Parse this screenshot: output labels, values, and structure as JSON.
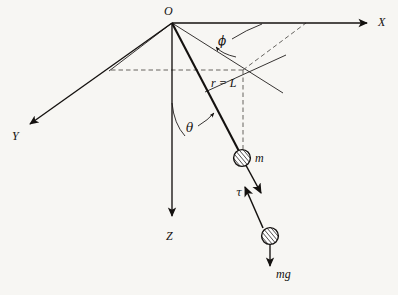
{
  "figure": {
    "background_color": "#f7f6f3",
    "ink_color": "#14110f",
    "labels": {
      "origin": "O",
      "axis_x": "X",
      "axis_y": "Y",
      "axis_z": "Z",
      "angle_phi": "ϕ",
      "angle_theta": "θ",
      "radius": "r = L",
      "mass": "m",
      "tension": "τ",
      "weight": "mg"
    }
  },
  "geometry": {
    "origin": {
      "x": 172,
      "y": 23
    },
    "axes": [
      {
        "name": "x-axis",
        "label": "X",
        "from": [
          172,
          23
        ],
        "to": [
          372,
          23
        ],
        "label_pos": [
          379,
          27
        ]
      },
      {
        "name": "y-axis",
        "label": "Y",
        "from": [
          172,
          23
        ],
        "to": [
          26,
          127
        ],
        "label_pos": [
          13,
          140
        ]
      },
      {
        "name": "z-axis",
        "label": "Z",
        "from": [
          172,
          23
        ],
        "to": [
          172,
          222
        ],
        "label_pos": [
          168,
          240
        ]
      }
    ],
    "rod": {
      "name": "r-equals-L",
      "from": [
        172,
        23
      ],
      "to": [
        242,
        158
      ],
      "label": "r = L",
      "label_pos": [
        212,
        86
      ]
    },
    "masses": [
      {
        "name": "pendulum-bob",
        "cx": 242,
        "cy": 158,
        "r": 8.5,
        "label": "m",
        "label_pos": [
          256,
          161
        ]
      },
      {
        "name": "free-body-bob",
        "cx": 270,
        "cy": 236,
        "r": 8.5
      }
    ],
    "vectors": [
      {
        "name": "tension-vector",
        "from": [
          262,
          200
        ],
        "to": [
          243,
          184
        ],
        "label": "τ",
        "label_pos": [
          238,
          193
        ]
      },
      {
        "name": "weight-vector",
        "from": [
          270,
          244
        ],
        "to": [
          270,
          270
        ],
        "label": "mg",
        "label_pos": [
          277,
          277
        ]
      },
      {
        "name": "bob-direction",
        "from": [
          242,
          158
        ],
        "to": [
          263,
          196
        ]
      }
    ],
    "angle_marks": [
      {
        "name": "phi-angle",
        "label": "ϕ",
        "label_pos": [
          222,
          44
        ]
      },
      {
        "name": "theta-angle",
        "label": "θ",
        "label_pos": [
          189,
          131
        ]
      }
    ],
    "projection_lines": [
      {
        "name": "horizontal-projection-dashed",
        "from": [
          111,
          70
        ],
        "to": [
          243,
          70
        ],
        "style": "dashed"
      },
      {
        "name": "vertical-drop-dashed",
        "from": [
          243,
          70
        ],
        "to": [
          243,
          150
        ],
        "style": "dashed"
      },
      {
        "name": "x-plane-dashed",
        "from": [
          243,
          70
        ],
        "to": [
          306,
          23
        ],
        "style": "dashed"
      },
      {
        "name": "left-plane-edge",
        "from": [
          172,
          23
        ],
        "to": [
          109,
          71
        ],
        "style": "solid"
      },
      {
        "name": "right-plane-edge",
        "from": [
          172,
          23
        ],
        "to": [
          283,
          93
        ],
        "style": "solid"
      },
      {
        "name": "cross-line",
        "from": [
          205,
          92
        ],
        "to": [
          285,
          56
        ],
        "style": "solid"
      }
    ]
  }
}
